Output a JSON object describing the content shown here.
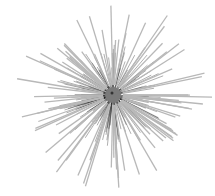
{
  "image": {
    "subject": "Radial wire bristle brush (chimney/pipe brush) viewed end-on",
    "background": "#ffffff",
    "width": 215,
    "height": 196,
    "hub": {
      "cx": 113,
      "cy": 95,
      "r": 8,
      "color": "#7a7a7a"
    },
    "bristles": {
      "count": 150,
      "dark_color": "#1a1a1a",
      "light_color": "#b8b8b8",
      "min_length": 55,
      "max_length": 100
    }
  }
}
